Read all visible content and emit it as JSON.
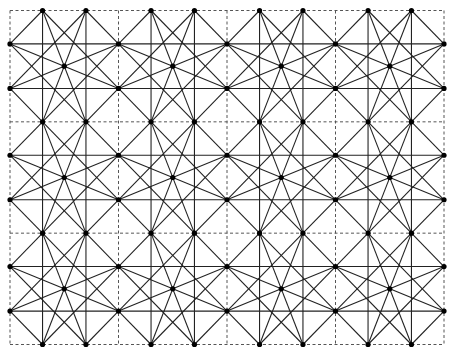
{
  "diagram": {
    "title": "",
    "frame": {
      "x0": 10,
      "y0": 10.5,
      "x1": 444,
      "y1": 344.5
    },
    "columns": 4,
    "rows": 3,
    "fractions": [
      0.3,
      0.7
    ],
    "colors": {
      "background": "#ffffff",
      "edge": "#222222",
      "dashed_grid": "#555555",
      "vertex": "#000000"
    },
    "vertex_radius": 2.6,
    "block_vertices": {
      "T1": [
        0.3,
        0.0
      ],
      "T2": [
        0.7,
        0.0
      ],
      "L1": [
        0.0,
        0.3
      ],
      "L2": [
        0.0,
        0.7
      ],
      "R1": [
        1.0,
        0.3
      ],
      "R2": [
        1.0,
        0.7
      ],
      "B1": [
        0.3,
        1.0
      ],
      "B2": [
        0.7,
        1.0
      ],
      "C": [
        0.5,
        0.5
      ]
    },
    "block_edges": [
      [
        "T1",
        "B1"
      ],
      [
        "T2",
        "B2"
      ],
      [
        "L1",
        "R1"
      ],
      [
        "L2",
        "R2"
      ],
      [
        "T1",
        "L1"
      ],
      [
        "T2",
        "R1"
      ],
      [
        "L2",
        "B1"
      ],
      [
        "R2",
        "B2"
      ],
      [
        "T1",
        "B2"
      ],
      [
        "T2",
        "B1"
      ],
      [
        "L1",
        "R2"
      ],
      [
        "L2",
        "R1"
      ],
      [
        "T1",
        "R2"
      ],
      [
        "T2",
        "L2"
      ],
      [
        "L1",
        "B2"
      ],
      [
        "R1",
        "B1"
      ]
    ]
  }
}
